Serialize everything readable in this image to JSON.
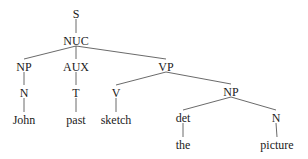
{
  "diagram": {
    "type": "syntax-tree",
    "nodes": [
      {
        "id": "S",
        "label": "S",
        "x": 76,
        "y": 14
      },
      {
        "id": "NUC",
        "label": "NUC",
        "x": 76,
        "y": 41
      },
      {
        "id": "NP1",
        "label": "NP",
        "x": 24,
        "y": 67
      },
      {
        "id": "AUX",
        "label": "AUX",
        "x": 76,
        "y": 67
      },
      {
        "id": "VP",
        "label": "VP",
        "x": 166,
        "y": 67
      },
      {
        "id": "N1",
        "label": "N",
        "x": 24,
        "y": 93
      },
      {
        "id": "T",
        "label": "T",
        "x": 76,
        "y": 93
      },
      {
        "id": "V",
        "label": "V",
        "x": 116,
        "y": 93
      },
      {
        "id": "NP2",
        "label": "NP",
        "x": 231,
        "y": 92
      },
      {
        "id": "John",
        "label": "John",
        "x": 24,
        "y": 120
      },
      {
        "id": "past",
        "label": "past",
        "x": 76,
        "y": 120
      },
      {
        "id": "sketch",
        "label": "sketch",
        "x": 116,
        "y": 120
      },
      {
        "id": "det",
        "label": "det",
        "x": 183,
        "y": 118
      },
      {
        "id": "N2",
        "label": "N",
        "x": 276,
        "y": 118
      },
      {
        "id": "the",
        "label": "the",
        "x": 183,
        "y": 145
      },
      {
        "id": "picture",
        "label": "picture",
        "x": 277,
        "y": 145
      }
    ],
    "edges": [
      [
        "S",
        "NUC"
      ],
      [
        "NUC",
        "NP1"
      ],
      [
        "NUC",
        "AUX"
      ],
      [
        "NUC",
        "VP"
      ],
      [
        "NP1",
        "N1"
      ],
      [
        "N1",
        "John"
      ],
      [
        "AUX",
        "T"
      ],
      [
        "T",
        "past"
      ],
      [
        "VP",
        "V"
      ],
      [
        "VP",
        "NP2"
      ],
      [
        "V",
        "sketch"
      ],
      [
        "NP2",
        "det"
      ],
      [
        "NP2",
        "N2"
      ],
      [
        "det",
        "the"
      ],
      [
        "N2",
        "picture"
      ]
    ]
  }
}
